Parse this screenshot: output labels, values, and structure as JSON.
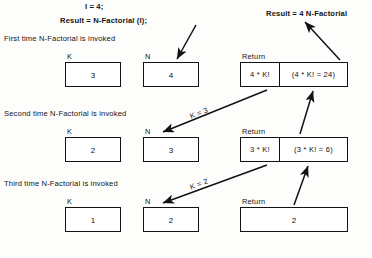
{
  "diagram": {
    "title_lines": {
      "line1": "I = 4;",
      "line2": "Result = N-Factorial (I);",
      "result_note": "Result = 4 N-Factorial"
    },
    "invocations": [
      {
        "caption": "First time N-Factorial is invoked",
        "k_label": "K",
        "k_value": "3",
        "n_label": "N",
        "n_value": "4",
        "return_label": "Return",
        "return_expr": "4 * K!",
        "return_eval": "(4 * K! = 24)"
      },
      {
        "caption": "Second time N-Factorial is invoked",
        "k_label": "K",
        "k_value": "2",
        "n_label": "N",
        "n_value": "3",
        "return_label": "Return",
        "return_expr": "3 * K!",
        "return_eval": "(3 * K! = 6)"
      },
      {
        "caption": "Third time N-Factorial is invoked",
        "k_label": "K",
        "k_value": "1",
        "n_label": "N",
        "n_value": "2",
        "return_label": "Return",
        "return_expr": "2",
        "return_eval": ""
      }
    ],
    "arrow_labels": {
      "k_eq_3": "K = 3",
      "k_eq_2": "K = 2"
    },
    "colors": {
      "ink": "#121212",
      "paper": "#fdfdfc"
    }
  }
}
